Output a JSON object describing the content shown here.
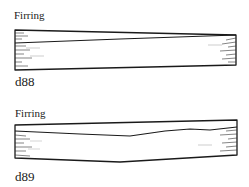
{
  "figures": [
    {
      "id_label": "d88",
      "caption": "Firring",
      "illustration": "firring-board-icon"
    },
    {
      "id_label": "d89",
      "caption": "Firring",
      "illustration": "firring-board-icon"
    }
  ],
  "colors": {
    "ink": "#1a1a1a",
    "background": "#ffffff"
  }
}
